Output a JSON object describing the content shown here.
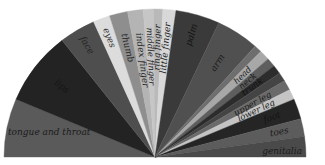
{
  "title": "",
  "diagram": {
    "type": "semicircular-fan",
    "center": [
      155,
      157
    ],
    "radius": [
      151,
      148
    ],
    "segments": [
      {
        "label": "tongue and throat",
        "start": 180,
        "end": 157,
        "color": "#5a5a5a",
        "text_color": "#1a1a1a",
        "label_r": 0.78,
        "horizontal": true
      },
      {
        "label": "lips",
        "start": 157,
        "end": 128,
        "color": "#232323",
        "text_color": "#151515",
        "label_r": 0.78
      },
      {
        "label": "face",
        "start": 128,
        "end": 114,
        "color": "#4e4e4e",
        "text_color": "#222222",
        "label_r": 0.88
      },
      {
        "label": "eyes",
        "start": 114,
        "end": 107.5,
        "color": "#dcdcdc",
        "text_color": "#333333",
        "label_r": 0.86
      },
      {
        "label": "thumb",
        "start": 107.5,
        "end": 100.5,
        "color": "#8e8e8e",
        "text_color": "#222222",
        "label_r": 0.76
      },
      {
        "label": "index finger",
        "start": 100.5,
        "end": 94.5,
        "color": "#b4b4b4",
        "text_color": "#222222",
        "label_r": 0.66
      },
      {
        "label": "middle finger",
        "start": 94.5,
        "end": 90.5,
        "color": "#c6c6c6",
        "text_color": "#222222",
        "label_r": 0.68
      },
      {
        "label": "ring finger",
        "start": 90.5,
        "end": 87,
        "color": "#b9b9b9",
        "text_color": "#222222",
        "label_r": 0.74
      },
      {
        "label": "little finger",
        "start": 87,
        "end": 82,
        "color": "#d8d8d8",
        "text_color": "#222222",
        "label_r": 0.74
      },
      {
        "label": "palm",
        "start": 82,
        "end": 65,
        "color": "#3a3a3a",
        "text_color": "#111111",
        "label_r": 0.86
      },
      {
        "label": "arm",
        "start": 65,
        "end": 48.5,
        "color": "#505050",
        "text_color": "#1a1a1a",
        "label_r": 0.76
      },
      {
        "label": "",
        "start": 48.5,
        "end": 45.5,
        "color": "#6e6e6e",
        "text_color": "#222222",
        "label_r": 0.8
      },
      {
        "label": "head",
        "start": 45.5,
        "end": 41.5,
        "color": "#a8a8a8",
        "text_color": "#222222",
        "label_r": 0.8
      },
      {
        "label": "neck",
        "start": 41.5,
        "end": 38,
        "color": "#5e5e5e",
        "text_color": "#1a1a1a",
        "label_r": 0.8
      },
      {
        "label": "trunk",
        "start": 38,
        "end": 34.5,
        "color": "#2c2c2c",
        "text_color": "#111111",
        "label_r": 0.8
      },
      {
        "label": "",
        "start": 34.5,
        "end": 31,
        "color": "#444444",
        "text_color": "#222222",
        "label_r": 0.8
      },
      {
        "label": "upper leg",
        "start": 31,
        "end": 27,
        "color": "#6a6a6a",
        "text_color": "#1a1a1a",
        "label_r": 0.74
      },
      {
        "label": "lower leg",
        "start": 27,
        "end": 23,
        "color": "#c4c4c4",
        "text_color": "#222222",
        "label_r": 0.74
      },
      {
        "label": "foot",
        "start": 23,
        "end": 15,
        "color": "#252525",
        "text_color": "#141414",
        "label_r": 0.82
      },
      {
        "label": "toes",
        "start": 15,
        "end": 8,
        "color": "#5c5c5c",
        "text_color": "#1a1a1a",
        "label_r": 0.84
      },
      {
        "label": "genitalia",
        "start": 8,
        "end": 0,
        "color": "#4a4a4a",
        "text_color": "#1a1a1a",
        "label_r": 0.8,
        "horizontal": true
      }
    ]
  }
}
